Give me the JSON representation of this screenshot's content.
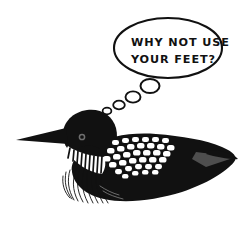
{
  "artwork": {
    "title": "Loon with thought bubble",
    "subject": "common-loon",
    "background_color": "#ffffff",
    "ink_color": "#111111",
    "accent_gray": "#5a5a5a",
    "spot_color": "#ffffff"
  },
  "thought_bubble": {
    "shape": "ellipse",
    "outline_color": "#111111",
    "fill_color": "#ffffff",
    "text_lines": [
      "WHY NOT USE",
      "YOUR FEET?"
    ],
    "full_text": "WHY NOT USE YOUR FEET?",
    "trail_bubbles": [
      {
        "label": "trail-bubble-1",
        "cx": 150,
        "cy": 86,
        "rx": 9.5,
        "ry": 7.0
      },
      {
        "label": "trail-bubble-2",
        "cx": 133,
        "cy": 97,
        "rx": 7.5,
        "ry": 5.6
      },
      {
        "label": "trail-bubble-3",
        "cx": 119,
        "cy": 105,
        "rx": 5.8,
        "ry": 4.3
      },
      {
        "label": "trail-bubble-4",
        "cx": 107,
        "cy": 111,
        "rx": 4.4,
        "ry": 3.3
      }
    ]
  },
  "loon": {
    "parts": [
      "beak",
      "head",
      "eye",
      "neck-collar-stripes",
      "breast-feathers",
      "body",
      "back-spots",
      "tail"
    ],
    "eye_color": "#6a6a6a",
    "beak_direction": "left",
    "back_spot_rows": 6,
    "collar_stripe_count": 13
  }
}
